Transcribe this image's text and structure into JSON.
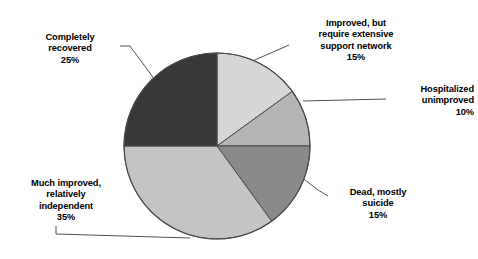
{
  "chart_data": {
    "type": "pie",
    "title": "",
    "subtitle": "",
    "xlabel": "",
    "ylabel": "",
    "legend_position": "none",
    "grid": false,
    "units": "percent",
    "total": 100,
    "start_angle_deg": 0,
    "direction": "clockwise",
    "categories": [
      "Improved, but require extensive support network",
      "Hospitalized unimproved",
      "Dead, mostly suicide",
      "Much improved, relatively independent",
      "Completely recovered"
    ],
    "values": [
      15,
      10,
      15,
      35,
      25
    ],
    "slices": [
      {
        "key": "improved_support",
        "label": "Improved, but\nrequire extensive\nsupport network",
        "percent_text": "15%",
        "value": 15,
        "color": "#d6d6d6"
      },
      {
        "key": "hospitalized",
        "label": "Hospitalized\nunimproved",
        "percent_text": "10%",
        "value": 10,
        "color": "#b5b5b5"
      },
      {
        "key": "dead",
        "label": "Dead, mostly\nsuicide",
        "percent_text": "15%",
        "value": 15,
        "color": "#8a8a8a"
      },
      {
        "key": "much_improved",
        "label": "Much improved,\nrelatively\nindependent",
        "percent_text": "35%",
        "value": 35,
        "color": "#c4c4c4"
      },
      {
        "key": "completely_recovered",
        "label": "Completely\nrecovered",
        "percent_text": "25%",
        "value": 25,
        "color": "#383838"
      }
    ],
    "stroke_color": "#4a4a4a",
    "leader_line_color": "#3d3d3d",
    "background_color": "#ffffff"
  }
}
